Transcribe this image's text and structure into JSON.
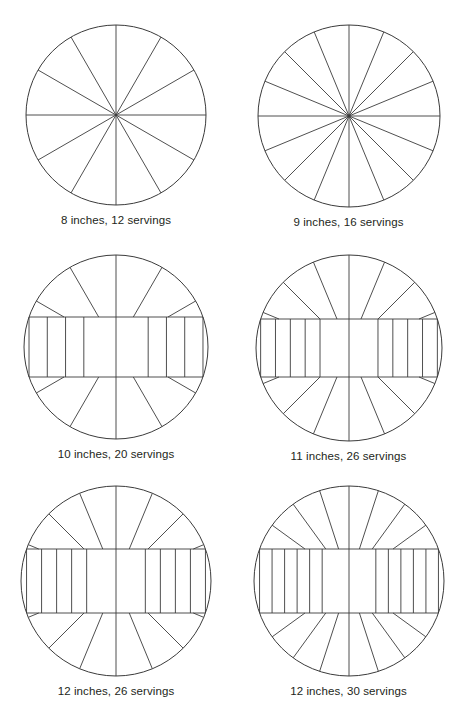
{
  "page": {
    "background_color": "#ffffff",
    "line_color": "#3b3b3b",
    "text_color": "#231f20"
  },
  "chart_data": {
    "type": "diagram",
    "xlabel": "",
    "ylabel": "",
    "legend": [],
    "categories": [
      "8 inches, 12 servings",
      "9 inches, 16 servings",
      "10 inches, 20 servings",
      "11 inches, 26 servings",
      "12 inches, 26 servings",
      "12 inches, 30 servings"
    ],
    "values": [
      12,
      16,
      20,
      26,
      26,
      30
    ],
    "series": [
      {
        "name": "Diameter (inches)",
        "values": [
          8,
          9,
          10,
          11,
          12,
          12
        ]
      },
      {
        "name": "Servings",
        "values": [
          12,
          16,
          20,
          26,
          26,
          30
        ]
      }
    ]
  },
  "diagrams": [
    {
      "id": "pizza-8in-12servings",
      "caption": "8 inches, 12 servings",
      "diameter_inches": 8,
      "servings": 12,
      "pattern": "radial",
      "radius_px": 90,
      "wedges": 12,
      "band": null
    },
    {
      "id": "pizza-9in-16servings",
      "caption": "9 inches, 16 servings",
      "diameter_inches": 9,
      "servings": 16,
      "pattern": "radial",
      "radius_px": 91,
      "wedges": 16,
      "band": null
    },
    {
      "id": "pizza-10in-20servings",
      "caption": "10 inches, 20 servings",
      "diameter_inches": 10,
      "servings": 20,
      "pattern": "band-and-wedges",
      "radius_px": 92,
      "wedges": 12,
      "band": {
        "half_height_px": 30,
        "strips_per_side": 4,
        "center_strips": 1
      }
    },
    {
      "id": "pizza-11in-26servings",
      "caption": "11 inches, 26 servings",
      "diameter_inches": 11,
      "servings": 26,
      "pattern": "band-and-wedges",
      "radius_px": 93,
      "wedges": 16,
      "band": {
        "half_height_px": 29,
        "strips_per_side": 5,
        "center_strips": 1
      }
    },
    {
      "id": "pizza-12in-26servings",
      "caption": "12 inches, 26 servings",
      "diameter_inches": 12,
      "servings": 26,
      "pattern": "band-and-wedges",
      "radius_px": 95,
      "wedges": 16,
      "band": {
        "half_height_px": 32,
        "strips_per_side": 5,
        "center_strips": 1
      }
    },
    {
      "id": "pizza-12in-30servings",
      "caption": "12 inches, 30 servings",
      "diameter_inches": 12,
      "servings": 30,
      "pattern": "band-and-wedges",
      "radius_px": 95,
      "wedges": 20,
      "band": {
        "half_height_px": 32,
        "strips_per_side": 6,
        "center_strips": 1
      }
    }
  ]
}
